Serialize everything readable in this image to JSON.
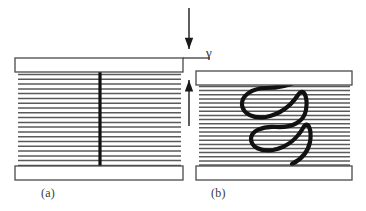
{
  "figure": {
    "background_color": "#ffffff",
    "width": 366,
    "height": 211,
    "line_color": "#5a5a5a",
    "plate_stroke_color": "#4a4a4a",
    "plate_fill_color": "#ffffff",
    "bold_stroke_color": "#111111",
    "arrow_color": "#1a1a1a",
    "symbols": {
      "shear_strain": "γ"
    },
    "panels": [
      {
        "id": "a",
        "caption": "(a)",
        "state": "undeformed",
        "marker": "straight-vertical-line",
        "plate_left": 15,
        "plate_right": 183,
        "top_plate_y": 58,
        "top_plate_height": 14,
        "bottom_plate_y": 166,
        "bottom_plate_height": 14,
        "lamellae_count": 20,
        "lamellae_top": 74,
        "lamellae_bottom": 165,
        "marker_x": 100,
        "marker_top": 72,
        "marker_bottom": 167,
        "marker_width": 3.2
      },
      {
        "id": "b",
        "caption": "(b)",
        "state": "sheared",
        "marker": "helical-coil-curve",
        "plate_left": 196,
        "plate_right": 352,
        "top_plate_y": 71,
        "top_plate_height": 14,
        "bottom_plate_y": 166,
        "bottom_plate_height": 14,
        "lamellae_count": 20,
        "lamellae_top": 86,
        "lamellae_bottom": 165,
        "coil_stroke_width": 4.2
      }
    ],
    "annotations": {
      "shear_arrow": {
        "label": "γ",
        "type": "down-arrow",
        "x": 189,
        "y_start": 8,
        "y_end": 57,
        "label_x": 206,
        "label_y": 45
      },
      "gap_arrow": {
        "type": "up-arrow",
        "x": 189,
        "y_start": 126,
        "y_end": 72
      }
    }
  }
}
